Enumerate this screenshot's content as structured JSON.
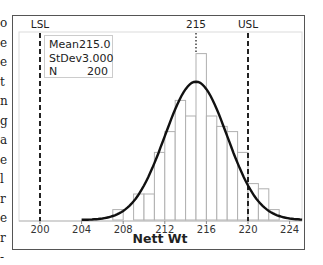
{
  "edge_fragment": [
    "o",
    "e",
    "e",
    "t",
    "n",
    "g",
    "a",
    "e",
    "l",
    "r",
    "e",
    "r",
    "-"
  ],
  "chart_data": {
    "type": "bar",
    "subtype": "histogram_with_normal_fit",
    "title": "",
    "xlabel": "Nett Wt",
    "ylabel": "",
    "xlim": [
      198,
      225.5
    ],
    "x_ticks": [
      200,
      204,
      208,
      212,
      216,
      220,
      224
    ],
    "bin_width": 1,
    "bins": [
      {
        "left": 207,
        "count": 2
      },
      {
        "left": 208,
        "count": 0
      },
      {
        "left": 209,
        "count": 5
      },
      {
        "left": 210,
        "count": 5
      },
      {
        "left": 211,
        "count": 13
      },
      {
        "left": 212,
        "count": 17
      },
      {
        "left": 213,
        "count": 23
      },
      {
        "left": 214,
        "count": 20
      },
      {
        "left": 215,
        "count": 32
      },
      {
        "left": 216,
        "count": 20
      },
      {
        "left": 217,
        "count": 18
      },
      {
        "left": 218,
        "count": 17
      },
      {
        "left": 219,
        "count": 13
      },
      {
        "left": 220,
        "count": 7
      },
      {
        "left": 221,
        "count": 6
      },
      {
        "left": 222,
        "count": 2
      }
    ],
    "normal_fit": {
      "mean": 215.0,
      "stdev": 3.0,
      "n": 200
    },
    "reference_lines": [
      {
        "label": "LSL",
        "value": 200,
        "style": "dashed"
      },
      {
        "label": "215",
        "value": 215,
        "style": "dotted"
      },
      {
        "label": "USL",
        "value": 220,
        "style": "dashed"
      }
    ],
    "stats_box": [
      {
        "label": "Mean",
        "value": "215.0"
      },
      {
        "label": "StDev",
        "value": "3.000"
      },
      {
        "label": "N",
        "value": "200"
      }
    ],
    "grid": false,
    "legend": "none"
  }
}
